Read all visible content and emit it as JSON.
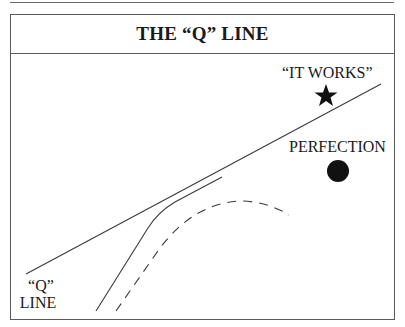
{
  "title": "THE “Q” LINE",
  "labels": {
    "it_works": "“IT WORKS”",
    "perfection": "PERFECTION",
    "q_line_top": "“Q”",
    "q_line_bottom": "LINE"
  },
  "markers": {
    "it_works": "star",
    "perfection": "circle"
  },
  "colors": {
    "line": "#3a3a3a",
    "marker": "#111111",
    "frame": "#5a5a5a"
  }
}
